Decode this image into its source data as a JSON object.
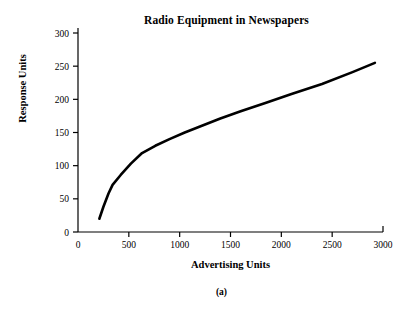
{
  "chart_data": {
    "type": "line",
    "title": "Radio Equipment in Newspapers",
    "xlabel": "Advertising Units",
    "ylabel": "Response Units",
    "caption": "(a)",
    "grid": false,
    "legend": null,
    "xlim": [
      0,
      3000
    ],
    "ylim": [
      0,
      300
    ],
    "xticks": [
      0,
      500,
      1000,
      1500,
      2000,
      2500,
      3000
    ],
    "yticks": [
      0,
      50,
      100,
      150,
      200,
      250,
      300
    ],
    "xtick_labels": [
      "0",
      "500",
      "1000",
      "1500",
      "2000",
      "2500",
      "3000"
    ],
    "ytick_labels": [
      "0",
      "50",
      "100",
      "150",
      "200",
      "250",
      "300"
    ],
    "line_color": "#000000",
    "line_width": 2.6,
    "axis_color": "#000000",
    "background": "#ffffff",
    "series": [
      {
        "name": "Response",
        "x": [
          210,
          250,
          300,
          340,
          420,
          520,
          630,
          760,
          900,
          1050,
          1200,
          1400,
          1600,
          1850,
          2100,
          2400,
          2700,
          2920
        ],
        "y": [
          20,
          38,
          58,
          71,
          86,
          103,
          119,
          130,
          140,
          150,
          159,
          171,
          182,
          195,
          208,
          223,
          241,
          255
        ]
      }
    ]
  }
}
